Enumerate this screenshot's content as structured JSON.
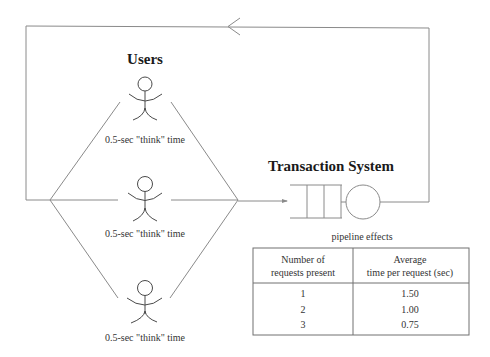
{
  "diagram": {
    "users_title": "Users",
    "system_title": "Transaction System",
    "users": [
      {
        "label": "0.5-sec \"think\" time"
      },
      {
        "label": "0.5-sec \"think\" time"
      },
      {
        "label": "0.5-sec \"think\" time"
      }
    ],
    "queue_caption": "pipeline effects",
    "colors": {
      "line": "#8a8a8a",
      "text": "#333333",
      "title": "#1a1a1a"
    }
  },
  "table": {
    "headers": [
      {
        "line1": "Number of",
        "line2": "requests present"
      },
      {
        "line1": "Average",
        "line2": "time per request (sec)"
      }
    ],
    "rows": [
      {
        "requests": "1",
        "time": "1.50"
      },
      {
        "requests": "2",
        "time": "1.00"
      },
      {
        "requests": "3",
        "time": "0.75"
      }
    ]
  }
}
